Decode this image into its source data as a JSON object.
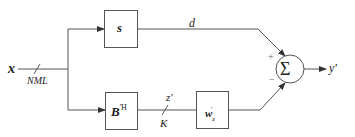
{
  "diagram": {
    "type": "block-diagram",
    "input": {
      "label": "x",
      "bus_width_label": "NML"
    },
    "blocks": [
      {
        "id": "s",
        "label": "s"
      },
      {
        "id": "blocking_matrix",
        "label": "B",
        "superscript": "'H"
      },
      {
        "id": "adaptive_filter",
        "label": "w",
        "subscript": "z",
        "prime": "'"
      }
    ],
    "signals": {
      "upper_branch": "d",
      "lower_branch": "z'",
      "lower_bus_width": "K",
      "output": "y'"
    },
    "summer": {
      "symbol": "Σ",
      "plus": "+",
      "minus": "−"
    },
    "colors": {
      "line": "#555555",
      "text": "#222222",
      "background": "#ffffff"
    }
  }
}
